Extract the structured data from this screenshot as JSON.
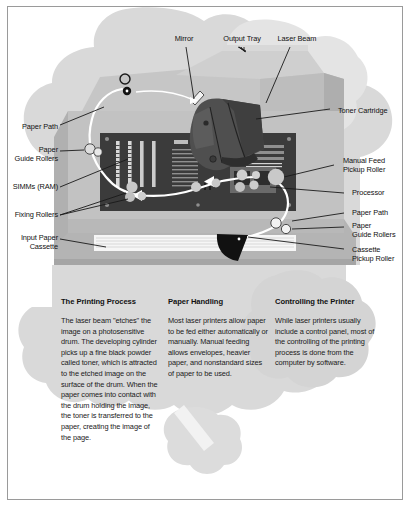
{
  "figure": {
    "colors": {
      "background": "#ffffff",
      "frame_border": "#9a9a9a",
      "blob_gray": "#d6d6d6",
      "blob_gray_light": "#e2e2e2",
      "printer_body": "#b8b8b8",
      "printer_body_light": "#c9c9c9",
      "printer_shadow": "#a3a3a3",
      "circuit_board": "#3c3c3c",
      "toner_cartridge": "#4a4a4a",
      "paper_path": "#ffffff",
      "leader_line": "#1a1a1a",
      "text": "#111111",
      "panel_band": "#cfcfcf"
    }
  },
  "callouts": [
    {
      "id": "mirror",
      "label": "Mirror",
      "align": "center",
      "x": 176,
      "y": 32
    },
    {
      "id": "output-tray",
      "label": "Output Tray",
      "align": "center",
      "x": 218,
      "y": 32
    },
    {
      "id": "laser-beam",
      "label": "Laser Beam",
      "align": "center",
      "x": 274,
      "y": 32
    },
    {
      "id": "toner-cartridge",
      "label": "Toner Cartridge",
      "align": "left",
      "x": 327,
      "y": 104
    },
    {
      "id": "paper-path-left",
      "label": "Paper Path",
      "align": "right",
      "x": 14,
      "y": 120
    },
    {
      "id": "paper-guide-rollers-l",
      "label": "Paper\nGuide Rollers",
      "align": "right",
      "x": 14,
      "y": 145
    },
    {
      "id": "simms-ram",
      "label": "SIMMs (RAM)",
      "align": "right",
      "x": 14,
      "y": 181
    },
    {
      "id": "fixing-rollers",
      "label": "Fixing Rollers",
      "align": "right",
      "x": 14,
      "y": 207
    },
    {
      "id": "input-paper-cassette",
      "label": "Input Paper\nCassette",
      "align": "right",
      "x": 14,
      "y": 231
    },
    {
      "id": "manual-feed-roller",
      "label": "Manual Feed\nPickup Roller",
      "align": "left",
      "x": 332,
      "y": 155
    },
    {
      "id": "processor",
      "label": "Processor",
      "align": "left",
      "x": 341,
      "y": 187
    },
    {
      "id": "paper-path-right",
      "label": "Paper Path",
      "align": "left",
      "x": 341,
      "y": 206
    },
    {
      "id": "paper-guide-rollers-r",
      "label": "Paper\nGuide Rollers",
      "align": "left",
      "x": 341,
      "y": 219
    },
    {
      "id": "cassette-pickup",
      "label": "Cassette\nPickup Roller",
      "align": "left",
      "x": 341,
      "y": 243
    }
  ],
  "columns": [
    {
      "id": "printing-process",
      "heading": "The Printing Process",
      "body": "The laser beam \"etches\" the image on a photosensitive drum. The developing cylinder picks up a fine black powder called toner, which is attracted to the etched image on the surface of the drum. When the paper comes into contact with the drum holding the image, the toner is transferred to the paper, creating the image of the page."
    },
    {
      "id": "paper-handling",
      "heading": "Paper Handling",
      "body": "Most laser printers allow paper to be fed either automatically or manually. Manual feeding allows envelopes, heavier paper, and nonstandard sizes of paper to be used."
    },
    {
      "id": "controlling-the-printer",
      "heading": "Controlling the Printer",
      "body": "While laser printers usually include a control panel, most of the controlling of the printing process is done from the computer by software."
    }
  ]
}
